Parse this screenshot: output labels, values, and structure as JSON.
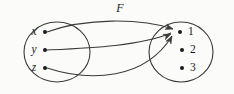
{
  "figure": {
    "function_name": "F",
    "function_label_x": 120,
    "function_label_y": 9,
    "background_color": "#fbfbfa",
    "ink_color": "#3a3a3a",
    "text_color": "#1a1a1a"
  },
  "domain_set": {
    "name": "domain-set",
    "center_x": 57,
    "center_y": 52,
    "radius_x": 33,
    "radius_y": 30,
    "elements": [
      {
        "label": "x",
        "label_x": 34,
        "label_y": 32,
        "dot_x": 45,
        "dot_y": 32
      },
      {
        "label": "y",
        "label_x": 34,
        "label_y": 50,
        "dot_x": 45,
        "dot_y": 50
      },
      {
        "label": "z",
        "label_x": 34,
        "label_y": 68,
        "dot_x": 45,
        "dot_y": 68
      }
    ]
  },
  "codomain_set": {
    "name": "codomain-set",
    "center_x": 181,
    "center_y": 52,
    "radius_x": 32,
    "radius_y": 30,
    "elements": [
      {
        "label": "1",
        "label_x": 188,
        "label_y": 32,
        "dot_x": 180,
        "dot_y": 32
      },
      {
        "label": "2",
        "label_x": 190,
        "label_y": 50,
        "dot_x": 182,
        "dot_y": 50
      },
      {
        "label": "3",
        "label_x": 190,
        "label_y": 68,
        "dot_x": 182,
        "dot_y": 68
      }
    ]
  },
  "mappings": [
    {
      "name": "mapping-x-to-1",
      "from": "x",
      "to": "1",
      "path": "M 47 32 C 85 18, 140 18, 173 29"
    },
    {
      "name": "mapping-y-to-1",
      "from": "y",
      "to": "1",
      "path": "M 47 50 C 90 48, 140 46, 171 33"
    },
    {
      "name": "mapping-z-to-1",
      "from": "z",
      "to": "1",
      "path": "M 47 68 C 90 82, 145 80, 172 36"
    }
  ],
  "arrowheads": [
    {
      "name": "arrowhead-x-to-1",
      "x": 173,
      "y": 29,
      "angle": 18
    },
    {
      "name": "arrowhead-y-to-1",
      "x": 171,
      "y": 34,
      "angle": -24
    },
    {
      "name": "arrowhead-z-to-1",
      "x": 172,
      "y": 36,
      "angle": -62
    }
  ]
}
